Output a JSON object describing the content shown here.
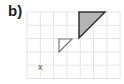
{
  "label": "b)",
  "grid": {
    "x0": 27,
    "y0": 12,
    "cell": 13.3,
    "cols": 7,
    "rows": 5,
    "color": "#e4e4e4"
  },
  "shapes": {
    "large_triangle": {
      "points": [
        [
          79,
          12
        ],
        [
          105,
          12
        ],
        [
          79,
          38
        ]
      ],
      "fill": "#b4b4b4",
      "stroke": "#333333"
    },
    "small_triangle": {
      "points": [
        [
          59,
          39
        ],
        [
          72,
          39
        ],
        [
          59,
          52
        ]
      ],
      "fill": "#ffffff",
      "stroke": "#777777"
    }
  },
  "marker": {
    "text": "x",
    "x": 38,
    "y": 70
  }
}
